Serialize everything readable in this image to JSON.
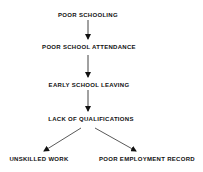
{
  "diagram": {
    "nodes": [
      {
        "id": "n1",
        "label": "POOR SCHOOLING"
      },
      {
        "id": "n2",
        "label": "POOR SCHOOL ATTENDANCE"
      },
      {
        "id": "n3",
        "label": "EARLY SCHOOL LEAVING"
      },
      {
        "id": "n4",
        "label": "LACK OF QUALIFICATIONS"
      },
      {
        "id": "n5",
        "label": "UNSKILLED WORK"
      },
      {
        "id": "n6",
        "label": "POOR EMPLOYMENT RECORD"
      }
    ],
    "edges": [
      {
        "from": "n1",
        "to": "n2"
      },
      {
        "from": "n2",
        "to": "n3"
      },
      {
        "from": "n3",
        "to": "n4"
      },
      {
        "from": "n4",
        "to": "n5"
      },
      {
        "from": "n4",
        "to": "n6"
      }
    ],
    "colors": {
      "line": "#111111",
      "text": "#111111",
      "background": "#ffffff"
    }
  }
}
